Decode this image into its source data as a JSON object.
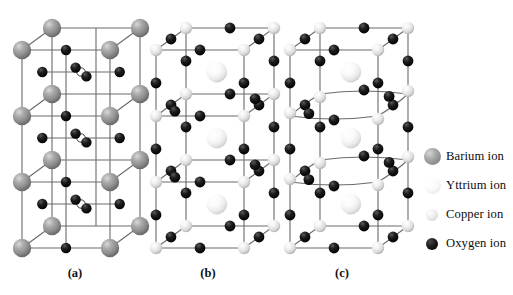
{
  "figure": {
    "background": "#ffffff",
    "subfigures": [
      {
        "id": "a",
        "label": "(a)",
        "description": "Perovskite-like stack with barium ions at corners, oxygen ions on edges and vacancies at layer centers"
      },
      {
        "id": "b",
        "label": "(b)",
        "description": "Unit cell with copper ions at corners, yttrium ions at centers and oxygen ions on edges, planar layers"
      },
      {
        "id": "c",
        "label": "(c)",
        "description": "Unit cell same as (b) but with buckled / distorted copper-oxygen planes"
      }
    ]
  },
  "legend": {
    "items": [
      {
        "name": "Barium ion",
        "label": "Barium ion",
        "swatch": "barium-sphere",
        "color": "#8e8e8e",
        "size": 17
      },
      {
        "name": "Yttrium ion",
        "label": "Yttrium ion",
        "swatch": "yttrium-sphere",
        "color": "#f2f2f2",
        "size": 17
      },
      {
        "name": "Copper ion",
        "label": "Copper ion",
        "swatch": "copper-sphere",
        "color": "#dcdcdc",
        "size": 12
      },
      {
        "name": "Oxygen ion",
        "label": "Oxygen ion",
        "swatch": "oxygen-sphere",
        "color": "#000000",
        "size": 12
      }
    ]
  },
  "colors": {
    "barium": "#8e8e8e",
    "yttrium": "#f4f4f4",
    "copper": "#dcdcdc",
    "oxygen": "#000000",
    "vacancy_fill": "#ffffff",
    "bond_line": "#6b6b6b",
    "background": "#ffffff"
  },
  "geometry": {
    "note": "Isometric cell projection; three stacked cubes per column",
    "cell_width": 88,
    "cell_depth_x": 30,
    "cell_depth_y": -22,
    "layer_height": 66,
    "layers": 3,
    "columns": [
      {
        "id": "a",
        "origin_x": 22,
        "origin_y": 248
      },
      {
        "id": "b",
        "origin_x": 156,
        "origin_y": 248
      },
      {
        "id": "c",
        "origin_x": 290,
        "origin_y": 248
      }
    ]
  }
}
